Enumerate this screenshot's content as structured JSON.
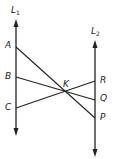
{
  "lines": {
    "L1": {
      "label": "L",
      "subscript": "1"
    },
    "L2": {
      "label": "L",
      "subscript": "2"
    }
  },
  "points": {
    "A": "A",
    "B": "B",
    "C": "C",
    "K": "K",
    "R": "R",
    "Q": "Q",
    "P": "P"
  },
  "segments": [
    {
      "from": "A",
      "to": "P"
    },
    {
      "from": "B",
      "to": "Q"
    },
    {
      "from": "C",
      "to": "R"
    }
  ],
  "colors": {
    "stroke": "#222222",
    "background": "#ffffff"
  }
}
